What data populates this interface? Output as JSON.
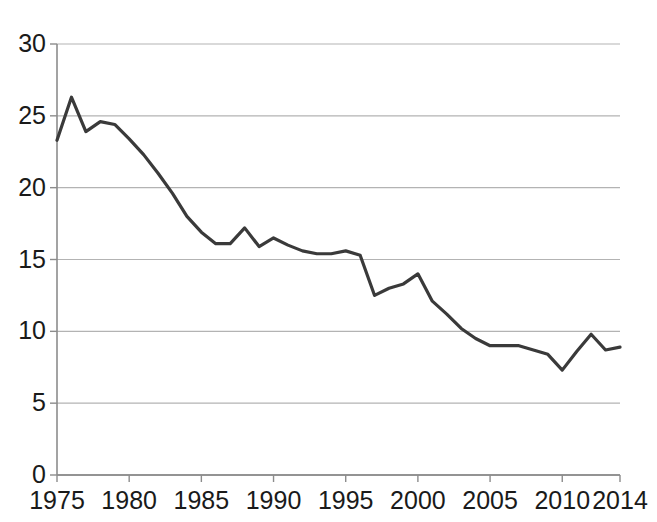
{
  "chart_data": {
    "type": "line",
    "title": "",
    "subtitle": "",
    "xlabel": "",
    "ylabel": "",
    "xlim": [
      1975,
      2014
    ],
    "ylim": [
      0,
      30
    ],
    "grid": true,
    "legend": false,
    "legend_position": "none",
    "line_color": "#3a3a3a",
    "grid_color": "#b3b3b3",
    "axis_color": "#8c8c8c",
    "text_color": "#1a1a1a",
    "ytick_labels": [
      "0",
      "5",
      "10",
      "15",
      "20",
      "25",
      "30"
    ],
    "ytick_values": [
      0,
      5,
      10,
      15,
      20,
      25,
      30
    ],
    "xtick_labels": [
      "1975",
      "1980",
      "1985",
      "1990",
      "1995",
      "2000",
      "2005",
      "2010",
      "2014"
    ],
    "xtick_values": [
      1975,
      1980,
      1985,
      1990,
      1995,
      2000,
      2005,
      2010,
      2014
    ],
    "x": [
      1975,
      1976,
      1977,
      1978,
      1979,
      1980,
      1981,
      1982,
      1983,
      1984,
      1985,
      1986,
      1987,
      1988,
      1989,
      1990,
      1991,
      1992,
      1993,
      1994,
      1995,
      1996,
      1997,
      1998,
      1999,
      2000,
      2001,
      2002,
      2003,
      2004,
      2005,
      2006,
      2007,
      2008,
      2009,
      2010,
      2011,
      2012,
      2013,
      2014
    ],
    "values": [
      23.3,
      26.3,
      23.9,
      24.6,
      24.4,
      23.4,
      22.3,
      21.0,
      19.6,
      18.0,
      16.9,
      16.1,
      16.1,
      17.2,
      15.9,
      16.5,
      16.0,
      15.6,
      15.4,
      15.4,
      15.6,
      15.3,
      12.5,
      13.0,
      13.3,
      14.0,
      12.1,
      11.2,
      10.2,
      9.5,
      9.0,
      9.0,
      9.0,
      8.7,
      8.4,
      7.3,
      8.6,
      9.8,
      8.7,
      8.9
    ],
    "series": [
      {
        "name": "series-1",
        "values": [
          23.3,
          26.3,
          23.9,
          24.6,
          24.4,
          23.4,
          22.3,
          21.0,
          19.6,
          18.0,
          16.9,
          16.1,
          16.1,
          17.2,
          15.9,
          16.5,
          16.0,
          15.6,
          15.4,
          15.4,
          15.6,
          15.3,
          12.5,
          13.0,
          13.3,
          14.0,
          12.1,
          11.2,
          10.2,
          9.5,
          9.0,
          9.0,
          9.0,
          8.7,
          8.4,
          7.3,
          8.6,
          9.8,
          8.7,
          8.9
        ]
      }
    ],
    "annotations": []
  }
}
